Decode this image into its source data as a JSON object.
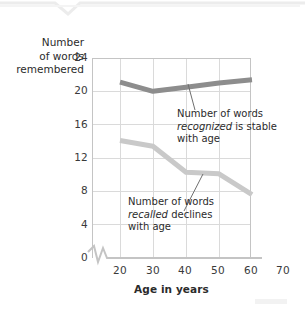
{
  "chart_data": {
    "type": "line",
    "title": "",
    "xlabel": "Age in years",
    "ylabel": "Number of words remembered",
    "x": [
      20,
      30,
      40,
      50,
      60
    ],
    "xlim": [
      15,
      70
    ],
    "ylim": [
      0,
      25
    ],
    "xticks": [
      "20",
      "30",
      "40",
      "50",
      "60",
      "70"
    ],
    "yticks": [
      "0",
      "4",
      "8",
      "12",
      "16",
      "20",
      "24"
    ],
    "grid": true,
    "legend": "none",
    "axis_break": "y-axis break between 0 and 4 near origin",
    "series": [
      {
        "name": "Number of words recognized",
        "values": [
          21.1,
          20.0,
          20.5,
          21.0,
          21.4
        ],
        "color": "#8d8d8d"
      },
      {
        "name": "Number of words recalled",
        "values": [
          14.1,
          13.4,
          10.3,
          10.1,
          7.6
        ],
        "color": "#c9c9c9"
      }
    ],
    "annotations": [
      {
        "id": "recognized",
        "line1": "Number of words",
        "emphasis": "recognized",
        "line2_rest": " is stable",
        "line3": "with age"
      },
      {
        "id": "recalled",
        "line1": "Number of words",
        "emphasis": "recalled",
        "line2_rest": " declines",
        "line3": "with age"
      }
    ]
  },
  "axes": {
    "y_title_line1": "Number",
    "y_title_line2": "of words",
    "y_title_line3": "remembered",
    "x_title": "Age in years"
  },
  "yticks": {
    "t0": "0",
    "t4": "4",
    "t8": "8",
    "t12": "12",
    "t16": "16",
    "t20": "20",
    "t24": "24"
  },
  "xticks": {
    "t20": "20",
    "t30": "30",
    "t40": "40",
    "t50": "50",
    "t60": "60",
    "t70": "70"
  },
  "annotations": {
    "recognized": {
      "l1": "Number of words",
      "em": "recognized",
      "l2rest": " is stable",
      "l3": "with age"
    },
    "recalled": {
      "l1": "Number of words",
      "em": "recalled",
      "l2rest": " declines",
      "l3": "with age"
    }
  },
  "colors": {
    "recognized_line": "#8d8d8d",
    "recalled_line": "#c9c9c9",
    "grid": "#d8d8d8",
    "axis": "#bdbdbd",
    "text": "#2b2b2b"
  }
}
